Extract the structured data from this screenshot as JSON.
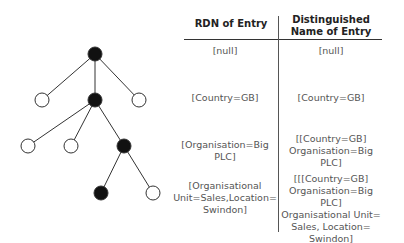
{
  "table": {
    "headers": {
      "rdn": "RDN of Entry",
      "dn_line1": "Distinguished",
      "dn_line2": "Name of Entry"
    },
    "rows": [
      {
        "rdn": [
          "[null]"
        ],
        "dn": [
          "[null]"
        ]
      },
      {
        "rdn": [
          "[Country=GB]"
        ],
        "dn": [
          "[Country=GB]"
        ]
      },
      {
        "rdn": [
          "[Organisation=Big PLC]"
        ],
        "dn": [
          "[[Country=GB]",
          "Organisation=Big PLC]"
        ]
      },
      {
        "rdn": [
          "[Organisational",
          "Unit=Sales,Location=",
          "Swindon]"
        ],
        "dn": [
          "[[[Country=GB]",
          "Organisation=Big PLC]",
          "Organisational Unit=",
          "Sales, Location=",
          "Swindon]"
        ]
      }
    ]
  },
  "tree": {
    "nodes": [
      {
        "id": "root",
        "x": 95,
        "y": 54,
        "filled": true
      },
      {
        "id": "l1-left",
        "x": 42,
        "y": 100,
        "filled": false
      },
      {
        "id": "l1-mid",
        "x": 95,
        "y": 100,
        "filled": true
      },
      {
        "id": "l1-right",
        "x": 139,
        "y": 100,
        "filled": false
      },
      {
        "id": "l2-left",
        "x": 28,
        "y": 146,
        "filled": false
      },
      {
        "id": "l2-mid",
        "x": 71,
        "y": 146,
        "filled": false
      },
      {
        "id": "l2-right",
        "x": 124,
        "y": 146,
        "filled": true
      },
      {
        "id": "l3-left",
        "x": 101,
        "y": 193,
        "filled": true
      },
      {
        "id": "l3-right",
        "x": 153,
        "y": 193,
        "filled": false
      }
    ],
    "edges": [
      [
        "root",
        "l1-left"
      ],
      [
        "root",
        "l1-mid"
      ],
      [
        "root",
        "l1-right"
      ],
      [
        "l1-mid",
        "l2-left"
      ],
      [
        "l1-mid",
        "l2-mid"
      ],
      [
        "l1-mid",
        "l2-right"
      ],
      [
        "l2-right",
        "l3-left"
      ],
      [
        "l2-right",
        "l3-right"
      ]
    ]
  }
}
